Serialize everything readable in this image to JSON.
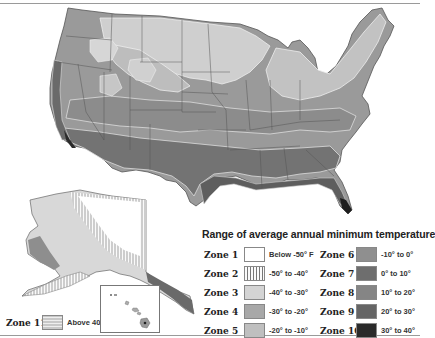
{
  "map": {
    "title": "Range of average annual minimum temperature",
    "regions": [
      "Contiguous United States",
      "Alaska",
      "Hawaii"
    ],
    "zones": [
      {
        "label": "Zone 1",
        "range": "Below -50° F",
        "color": "#ffffff",
        "pattern": "none"
      },
      {
        "label": "Zone 2",
        "range": "-50° to -40°",
        "color": "#f2f2f2",
        "pattern": "vertical-stripes"
      },
      {
        "label": "Zone 3",
        "range": "-40° to -30°",
        "color": "#d4d4d4",
        "pattern": "none"
      },
      {
        "label": "Zone 4",
        "range": "-30° to -20°",
        "color": "#a8a8a8",
        "pattern": "none"
      },
      {
        "label": "Zone 5",
        "range": "-20° to -10°",
        "color": "#bfbfbf",
        "pattern": "none"
      },
      {
        "label": "Zone 6",
        "range": "-10° to 0°",
        "color": "#8f8f8f",
        "pattern": "none"
      },
      {
        "label": "Zone 7",
        "range": "0° to 10°",
        "color": "#6e6e6e",
        "pattern": "none"
      },
      {
        "label": "Zone 8",
        "range": "10° to 20°",
        "color": "#858585",
        "pattern": "none"
      },
      {
        "label": "Zone 9",
        "range": "20° to 30°",
        "color": "#656565",
        "pattern": "none"
      },
      {
        "label": "Zone 10",
        "range": "30° to 40°",
        "color": "#2a2a2a",
        "pattern": "none"
      },
      {
        "label": "Zone 11",
        "range": "Above 40°",
        "color": "#c8c8c8",
        "pattern": "horizontal-stripes"
      }
    ]
  }
}
